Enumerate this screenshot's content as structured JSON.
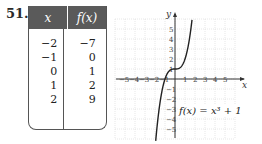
{
  "problem_number": "51.",
  "table": {
    "headers": [
      "x",
      "f(x)"
    ],
    "rows": [
      {
        "x": "−2",
        "fx": "−7"
      },
      {
        "x": "−1",
        "fx": "0"
      },
      {
        "x": "0",
        "fx": "1"
      },
      {
        "x": "1",
        "fx": "2"
      },
      {
        "x": "2",
        "fx": "9"
      }
    ]
  },
  "graph": {
    "x_axis_label": "x",
    "y_axis_label": "y",
    "function_label": "f(x) = x³ + 1"
  },
  "chart_data": {
    "type": "line",
    "title": "",
    "function": "f(x) = x^3 + 1",
    "xlabel": "x",
    "ylabel": "y",
    "xlim": [
      -6,
      6
    ],
    "ylim": [
      -6,
      6
    ],
    "grid": true,
    "x_ticks": [
      -5,
      -4,
      -3,
      -2,
      -1,
      1,
      2,
      3,
      4,
      5
    ],
    "y_ticks": [
      -5,
      -4,
      -3,
      -2,
      -1,
      1,
      2,
      3,
      4,
      5
    ],
    "series": [
      {
        "name": "f(x) = x^3 + 1",
        "x": [
          -1.9,
          -1.5,
          -1,
          -0.5,
          0,
          0.5,
          1,
          1.5,
          1.7
        ],
        "values": [
          -5.86,
          -2.38,
          0,
          0.88,
          1,
          1.13,
          2,
          4.38,
          5.91
        ]
      }
    ],
    "annotations": [
      "f(x) = x³ + 1"
    ]
  }
}
